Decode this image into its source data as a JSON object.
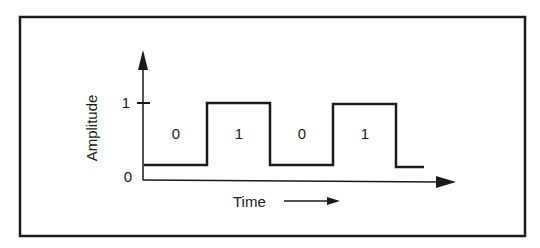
{
  "diagram": {
    "type": "digital-signal-waveform",
    "y_axis": {
      "label": "Amplitude",
      "ticks": [
        {
          "label": "0",
          "value": 0
        },
        {
          "label": "1",
          "value": 1
        }
      ]
    },
    "x_axis": {
      "label": "Time"
    },
    "bits": [
      {
        "label": "0",
        "level": 0
      },
      {
        "label": "1",
        "level": 1
      },
      {
        "label": "0",
        "level": 0
      },
      {
        "label": "1",
        "level": 1
      }
    ],
    "colors": {
      "stroke": "#1a1a1a",
      "background": "#ffffff"
    }
  }
}
